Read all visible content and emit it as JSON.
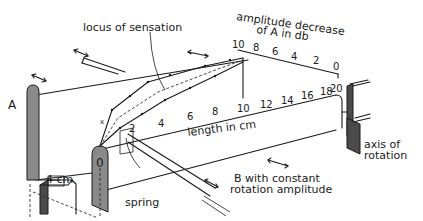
{
  "diagram": {
    "labels": {
      "locus": "locus of sensation",
      "amplitude_line1": "amplitude decrease",
      "amplitude_line2": "of A in db",
      "length": "length in cm",
      "plate_a": "A",
      "plate_o": "0",
      "four_cm": "4 cm",
      "spring": "spring",
      "b_line1": "B with constant",
      "b_line2": "rotation amplitude",
      "axis_line1": "axis of",
      "axis_line2": "rotation"
    },
    "db_scale": [
      "10",
      "8",
      "6",
      "4",
      "2",
      "0"
    ],
    "length_scale": [
      "2",
      "4",
      "6",
      "8",
      "10",
      "12",
      "14",
      "16",
      "18",
      "20"
    ]
  }
}
